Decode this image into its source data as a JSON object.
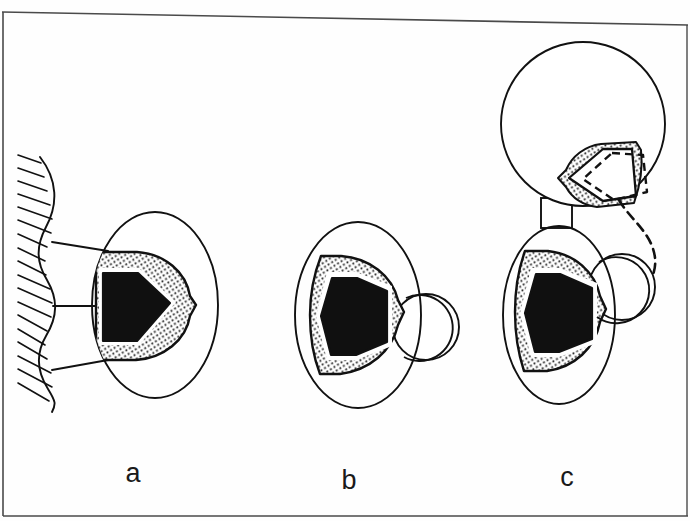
{
  "figure": {
    "kind": "scientific-line-diagram",
    "background_color": "#fefefe",
    "ink_color": "#111111",
    "fill_black": "#101010",
    "fill_white": "#ffffff",
    "stipple_color": "#2b2b2b",
    "width": 690,
    "height": 521,
    "panel_count": 3
  },
  "borders": {
    "top_rule": "present",
    "left_rule": "present",
    "bottom_rule": "present",
    "right_rule": "present"
  },
  "panels": [
    {
      "id": "a",
      "label": "a",
      "label_x": 133,
      "label_y": 482,
      "description": "Cell attached to a scalloped, hatched epithelial wall by three radiating strands; cell contains a stippled crescent enclosing a solid black pentagon.",
      "cell": {
        "shape": "ellipse",
        "cx": 155,
        "cy": 305,
        "rx": 63,
        "ry": 93
      },
      "stipple_region": "crescent-shield pointing right",
      "inclusion": {
        "shape": "pentagon",
        "fill": "black",
        "points_toward": "right"
      },
      "substrate": {
        "present": true,
        "type": "hatched-scalloped-wall",
        "hatch_count": 17,
        "scallop_count": 4,
        "attachment_strands": 3
      },
      "satellite_vesicle": {
        "present": false
      }
    },
    {
      "id": "b",
      "label": "b",
      "label_x": 349,
      "label_y": 489,
      "description": "Free detached cell; stippled crescent with solid black pentagon, plus a small round satellite vesicle budding at the right margin.",
      "cell": {
        "shape": "ellipse",
        "cx": 358,
        "cy": 315,
        "rx": 63,
        "ry": 93
      },
      "stipple_region": "crescent-shield pointing right",
      "inclusion": {
        "shape": "pentagon",
        "fill": "black",
        "points_toward": "right"
      },
      "substrate": {
        "present": false
      },
      "satellite_vesicle": {
        "present": true,
        "cx": 426,
        "cy": 327,
        "r": 33
      }
    },
    {
      "id": "c",
      "label": "c",
      "label_x": 567,
      "label_y": 486,
      "description": "Paired cells joined by a rectangular cytoplasmic bridge. Upper round cell holds an unfilled outlined pentagon in a stippled crescent with a dashed displaced pentagon outline; a dashed trajectory arc sweeps from it down to the satellite vesicle of the lower cell, whose crescent holds a solid black pentagon.",
      "upper_cell": {
        "shape": "circle",
        "cx": 583,
        "cy": 124,
        "r": 82
      },
      "upper_inclusion": {
        "shape": "pentagon",
        "fill": "white",
        "stroke": "solid",
        "points_toward": "left"
      },
      "upper_ghost_inclusion": {
        "shape": "pentagon",
        "fill": "none",
        "stroke": "dashed",
        "points_toward": "left"
      },
      "bridge": {
        "shape": "rectangle",
        "x": 541,
        "y": 198,
        "width": 31,
        "height": 30
      },
      "lower_cell": {
        "shape": "ellipse",
        "cx": 559,
        "cy": 315,
        "rx": 56,
        "ry": 89
      },
      "lower_inclusion": {
        "shape": "pentagon",
        "fill": "black",
        "points_toward": "right"
      },
      "satellite_vesicle": {
        "present": true,
        "cx": 622,
        "cy": 287,
        "r": 33
      },
      "trajectory": {
        "present": true,
        "style": "dashed",
        "direction": "from upper ghost pentagon curving down-right to lower satellite vesicle"
      }
    }
  ],
  "labels": {
    "a": "a",
    "b": "b",
    "c": "c"
  }
}
